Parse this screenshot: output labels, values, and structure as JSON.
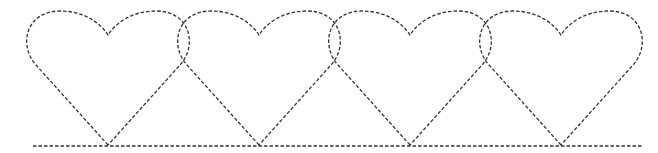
{
  "diagram": {
    "title": "",
    "stroke_color": "#333333",
    "background": "#ffffff",
    "shapes": [
      {
        "type": "heart",
        "tip_x": 108,
        "tip_y": 145,
        "style": "dashed"
      },
      {
        "type": "heart",
        "tip_x": 259,
        "tip_y": 145,
        "style": "dashed"
      },
      {
        "type": "heart",
        "tip_x": 410,
        "tip_y": 145,
        "style": "dashed"
      },
      {
        "type": "heart",
        "tip_x": 561,
        "tip_y": 145,
        "style": "dashed"
      }
    ],
    "baseline": {
      "x1": 33,
      "x2": 642,
      "y": 146,
      "style": "dashed"
    }
  }
}
